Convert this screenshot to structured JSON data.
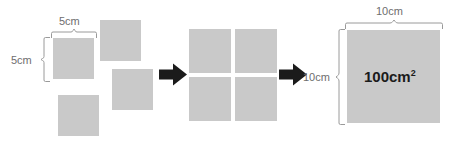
{
  "diagram": {
    "colors": {
      "square_fill": "#c9c9c9",
      "dimension_line": "#9a9a9a",
      "dimension_text": "#6e6e6e",
      "arrow_fill": "#1b1b1b",
      "area_text": "#1b1b1b",
      "background": "#ffffff"
    },
    "stage": {
      "width": 451,
      "height": 152
    },
    "groups": [
      {
        "name": "scattered-squares",
        "squares": [
          {
            "name": "square-1",
            "x": 53,
            "y": 38,
            "w": 41,
            "h": 41
          },
          {
            "name": "square-2",
            "x": 100,
            "y": 20,
            "w": 41,
            "h": 41
          },
          {
            "name": "square-3",
            "x": 112,
            "y": 69,
            "w": 41,
            "h": 41
          },
          {
            "name": "square-4",
            "x": 58,
            "y": 95,
            "w": 41,
            "h": 41
          }
        ]
      },
      {
        "name": "assembled-grid",
        "squares": [
          {
            "name": "grid-square-top-left",
            "x": 189,
            "y": 29,
            "w": 42,
            "h": 44
          },
          {
            "name": "grid-square-top-right",
            "x": 235,
            "y": 29,
            "w": 42,
            "h": 44
          },
          {
            "name": "grid-square-bottom-left",
            "x": 189,
            "y": 77,
            "w": 42,
            "h": 44
          },
          {
            "name": "grid-square-bottom-right",
            "x": 235,
            "y": 77,
            "w": 42,
            "h": 44
          }
        ]
      },
      {
        "name": "result-square",
        "squares": [
          {
            "name": "result-big-square",
            "x": 347,
            "y": 30,
            "w": 93,
            "h": 93
          }
        ]
      }
    ],
    "arrows": [
      {
        "name": "arrow-1",
        "x": 159,
        "y": 63,
        "w": 28,
        "h": 22
      },
      {
        "name": "arrow-2",
        "x": 279,
        "y": 63,
        "w": 28,
        "h": 22
      }
    ],
    "labels": {
      "left_width": "5cm",
      "left_height": "5cm",
      "right_width": "10cm",
      "right_height": "10cm",
      "area_value": "100cm",
      "area_exponent": "2"
    },
    "braces": [
      {
        "name": "brace-top-left",
        "orientation": "horizontal"
      },
      {
        "name": "brace-side-left",
        "orientation": "vertical"
      },
      {
        "name": "brace-top-right",
        "orientation": "horizontal"
      },
      {
        "name": "brace-side-right",
        "orientation": "vertical"
      }
    ]
  }
}
